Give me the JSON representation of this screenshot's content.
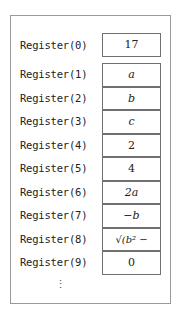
{
  "registers": [
    {
      "label": "Register(0)",
      "value": "17",
      "math": false
    },
    {
      "label": "Register(1)",
      "value": "a",
      "math": true
    },
    {
      "label": "Register(2)",
      "value": "b",
      "math": true
    },
    {
      "label": "Register(3)",
      "value": "c",
      "math": true
    },
    {
      "label": "Register(4)",
      "value": "2",
      "math": false
    },
    {
      "label": "Register(5)",
      "value": "4",
      "math": false
    },
    {
      "label": "Register(6)",
      "value": "2a",
      "math": true
    },
    {
      "label": "Register(7)",
      "value": "−b",
      "math": true
    },
    {
      "label": "Register(8)",
      "value": "√(b² − 4ac)",
      "math": true
    },
    {
      "label": "Register(9)",
      "value": "0",
      "math": false
    }
  ],
  "continuation": "⋮"
}
